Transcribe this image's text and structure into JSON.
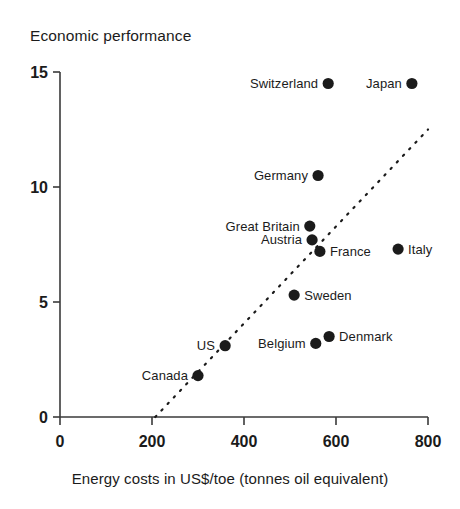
{
  "chart_data": {
    "type": "scatter",
    "title": "Economic performance",
    "ylabel": "Economic performance",
    "xlabel": "Energy costs in US$/toe (tonnes oil equivalent)",
    "xlim": [
      0,
      800
    ],
    "ylim": [
      0,
      15
    ],
    "xticks": [
      "0",
      "200",
      "400",
      "600",
      "800"
    ],
    "xtick_values": [
      0,
      200,
      400,
      600,
      800
    ],
    "yticks": [
      "0",
      "5",
      "10",
      "15"
    ],
    "ytick_values": [
      0,
      5,
      10,
      15
    ],
    "grid": false,
    "legend": "none",
    "points": [
      {
        "label": "Switzerland",
        "x": 583,
        "y": 14.5,
        "label_side": "left"
      },
      {
        "label": "Japan",
        "x": 765,
        "y": 14.5,
        "label_side": "left"
      },
      {
        "label": "Germany",
        "x": 561,
        "y": 10.5,
        "label_side": "left"
      },
      {
        "label": "Great Britain",
        "x": 543,
        "y": 8.3,
        "label_side": "left"
      },
      {
        "label": "Austria",
        "x": 548,
        "y": 7.7,
        "label_side": "left"
      },
      {
        "label": "France",
        "x": 565,
        "y": 7.2,
        "label_side": "right"
      },
      {
        "label": "Italy",
        "x": 735,
        "y": 7.3,
        "label_side": "right"
      },
      {
        "label": "Sweden",
        "x": 509,
        "y": 5.3,
        "label_side": "right"
      },
      {
        "label": "Denmark",
        "x": 585,
        "y": 3.5,
        "label_side": "right"
      },
      {
        "label": "Belgium",
        "x": 556,
        "y": 3.2,
        "label_side": "left"
      },
      {
        "label": "US",
        "x": 359,
        "y": 3.1,
        "label_side": "left"
      },
      {
        "label": "Canada",
        "x": 300,
        "y": 1.8,
        "label_side": "left"
      }
    ],
    "trendline": {
      "x1": 207,
      "y1": 0,
      "x2": 800,
      "y2": 12.5,
      "style": "dotted"
    },
    "colors": {
      "marker": "#1b1b1b",
      "axis": "#3a3a3a",
      "background": "#ffffff"
    }
  }
}
